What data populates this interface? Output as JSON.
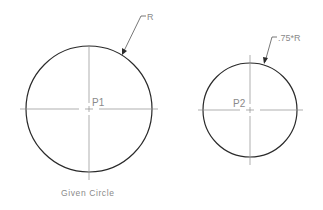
{
  "diagram": {
    "circle1": {
      "center_label": "P1",
      "radius_label": "R",
      "caption": "Given Circle"
    },
    "circle2": {
      "center_label": "P2",
      "radius_label": ".75*R"
    },
    "colors": {
      "outline": "#2a2a2a",
      "centerline": "#8c8c8c",
      "text": "#8a8a8a"
    }
  }
}
